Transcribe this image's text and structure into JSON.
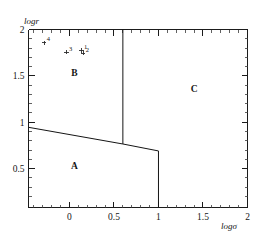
{
  "chart_data": {
    "type": "scatter",
    "title": "",
    "xlabel": "logσ",
    "ylabel": "logr",
    "xlim": [
      -0.46,
      2.0
    ],
    "ylim": [
      0.08,
      2.0
    ],
    "grid": false,
    "legend": "none",
    "x_ticks": [
      {
        "value": 0,
        "label": "0"
      },
      {
        "value": 0.5,
        "label": "0.5"
      },
      {
        "value": 1,
        "label": "1"
      },
      {
        "value": 1.5,
        "label": "1.5"
      },
      {
        "value": 2,
        "label": "2"
      }
    ],
    "y_ticks": [
      {
        "value": 0.5,
        "label": "0.5"
      },
      {
        "value": 1,
        "label": "1"
      },
      {
        "value": 1.5,
        "label": "1.5"
      },
      {
        "value": 2,
        "label": "2"
      }
    ],
    "x_minor_ticks": [
      -0.4,
      -0.3,
      -0.2,
      -0.1,
      0.1,
      0.2,
      0.3,
      0.4,
      0.6,
      0.7,
      0.8,
      0.9,
      1.1,
      1.2,
      1.3,
      1.4,
      1.6,
      1.7,
      1.8,
      1.9
    ],
    "y_minor_ticks": [
      0.2,
      0.3,
      0.4,
      0.6,
      0.7,
      0.8,
      0.9,
      1.1,
      1.2,
      1.3,
      1.4,
      1.6,
      1.7,
      1.8,
      1.9
    ],
    "points": [
      {
        "label": "4",
        "x": -0.285,
        "y": 1.855
      },
      {
        "label": "3",
        "x": -0.035,
        "y": 1.755
      },
      {
        "label": "1",
        "x": 0.135,
        "y": 1.775
      },
      {
        "label": "2",
        "x": 0.155,
        "y": 1.745
      }
    ],
    "marker_style": "plus",
    "regions": [
      {
        "label": "A",
        "x": 0.055,
        "y": 0.5
      },
      {
        "label": "B",
        "x": 0.055,
        "y": 1.5
      },
      {
        "label": "C",
        "x": 1.4,
        "y": 1.33
      }
    ],
    "boundaries": [
      {
        "name": "sloped-divider",
        "points": [
          [
            -0.46,
            0.945
          ],
          [
            0.6,
            0.765
          ],
          [
            1.0,
            0.69
          ]
        ]
      },
      {
        "name": "vertical-divider-upper",
        "points": [
          [
            0.6,
            2.0
          ],
          [
            0.6,
            0.765
          ]
        ]
      },
      {
        "name": "vertical-divider-lower",
        "points": [
          [
            1.0,
            0.69
          ],
          [
            1.0,
            0.08
          ]
        ]
      }
    ]
  },
  "axis_titles": {
    "x": "logσ",
    "y": "logr"
  },
  "colors": {
    "line": "#151515",
    "axis": "#1b1b1b",
    "background": "#ffffff"
  }
}
